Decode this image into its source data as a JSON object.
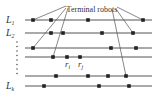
{
  "diagram": {
    "callout": {
      "text": "Terminal robots",
      "x": 92,
      "y": 12
    },
    "lines": [
      {
        "label": "L",
        "sub": "1",
        "y": 20,
        "robots": [
          33,
          51,
          88,
          143
        ]
      },
      {
        "label": "L",
        "sub": "2",
        "y": 33,
        "robots": [
          51,
          63,
          102,
          133
        ]
      },
      {
        "label": "",
        "sub": "",
        "y": 48,
        "robots": [
          33,
          111,
          136
        ]
      },
      {
        "label": "",
        "sub": "",
        "y": 57,
        "robots": [
          53,
          67,
          80
        ]
      },
      {
        "label": "",
        "sub": "",
        "y": 76,
        "robots": [
          56,
          88,
          108,
          126
        ]
      },
      {
        "label": "L",
        "sub": "k",
        "y": 86,
        "robots": [
          44,
          99,
          129
        ]
      }
    ],
    "robot_labels": [
      {
        "text": "r",
        "sub": "i",
        "x": 65,
        "y": 67
      },
      {
        "text": "r",
        "sub": "j",
        "x": 78,
        "y": 67
      }
    ],
    "pointers": [
      {
        "from": [
          66,
          6
        ],
        "to": [
          33,
          20
        ]
      },
      {
        "from": [
          66,
          8
        ],
        "to": [
          33,
          48
        ]
      },
      {
        "from": [
          68,
          8
        ],
        "to": [
          53,
          57
        ]
      },
      {
        "from": [
          117,
          7
        ],
        "to": [
          143,
          20
        ]
      },
      {
        "from": [
          116,
          9
        ],
        "to": [
          133,
          33
        ]
      },
      {
        "from": [
          112,
          9
        ],
        "to": [
          126,
          76
        ]
      }
    ],
    "line_x_start": 25,
    "line_x_end": 152,
    "colors": {
      "line": "#555555",
      "robot": "#222222",
      "text": "#333333"
    }
  }
}
